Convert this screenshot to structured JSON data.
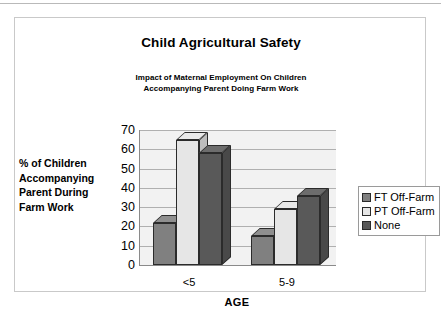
{
  "chart_data": {
    "type": "bar",
    "title": "Child Agricultural Safety",
    "subtitle_line1": "Impact of Maternal Employment On Children",
    "subtitle_line2": "Accompanying Parent Doing Farm Work",
    "xlabel": "AGE",
    "ylabel_line1": "% of Children",
    "ylabel_line2": "Accompanying",
    "ylabel_line3": "Parent During",
    "ylabel_line4": "Farm Work",
    "categories": [
      "<5",
      "5-9"
    ],
    "yticks": [
      70,
      60,
      50,
      40,
      30,
      20,
      10,
      0
    ],
    "ylim": [
      0,
      70
    ],
    "grid": true,
    "legend_position": "right",
    "series": [
      {
        "name": "FT Off-Farm",
        "color": "#808080",
        "values": [
          22,
          15
        ]
      },
      {
        "name": "PT Off-Farm",
        "color": "#e6e6e6",
        "values": [
          65,
          29
        ]
      },
      {
        "name": "None",
        "color": "#595959",
        "values": [
          58,
          36
        ]
      }
    ]
  },
  "legend": {
    "items": [
      {
        "label": "FT Off-Farm"
      },
      {
        "label": "PT Off-Farm"
      },
      {
        "label": "None"
      }
    ]
  }
}
